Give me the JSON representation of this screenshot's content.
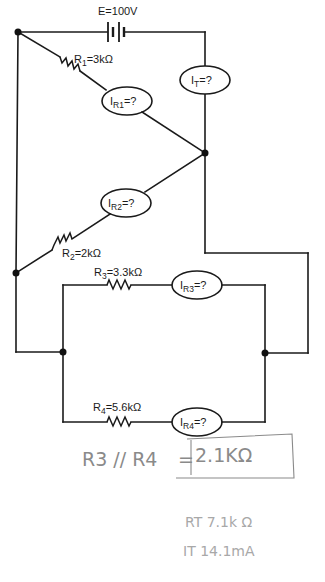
{
  "diagram": {
    "type": "circuit-schematic",
    "source": {
      "label": "E=100V"
    },
    "resistors": [
      {
        "id": "R1",
        "name": "R",
        "sub": "1",
        "value": "=3kΩ"
      },
      {
        "id": "R2",
        "name": "R",
        "sub": "2",
        "value": "=2kΩ"
      },
      {
        "id": "R3",
        "name": "R",
        "sub": "3",
        "value": "=3.3kΩ"
      },
      {
        "id": "R4",
        "name": "R",
        "sub": "4",
        "value": "=5.6kΩ"
      }
    ],
    "meters": [
      {
        "id": "IT",
        "name": "I",
        "sub": "T",
        "value": "=?"
      },
      {
        "id": "IR1",
        "name": "I",
        "sub": "R1",
        "value": "=?"
      },
      {
        "id": "IR2",
        "name": "I",
        "sub": "R2",
        "value": "=?"
      },
      {
        "id": "IR3",
        "name": "I",
        "sub": "R3",
        "value": "=?"
      },
      {
        "id": "IR4",
        "name": "I",
        "sub": "R4",
        "value": "=?"
      }
    ]
  },
  "handwritten_notes": {
    "parallel_label": "R3 // R4",
    "equals": "=",
    "parallel_result": "2.1KΩ",
    "rt_line": "RT 7.1k Ω",
    "it_line": "IT 14.1mA"
  }
}
